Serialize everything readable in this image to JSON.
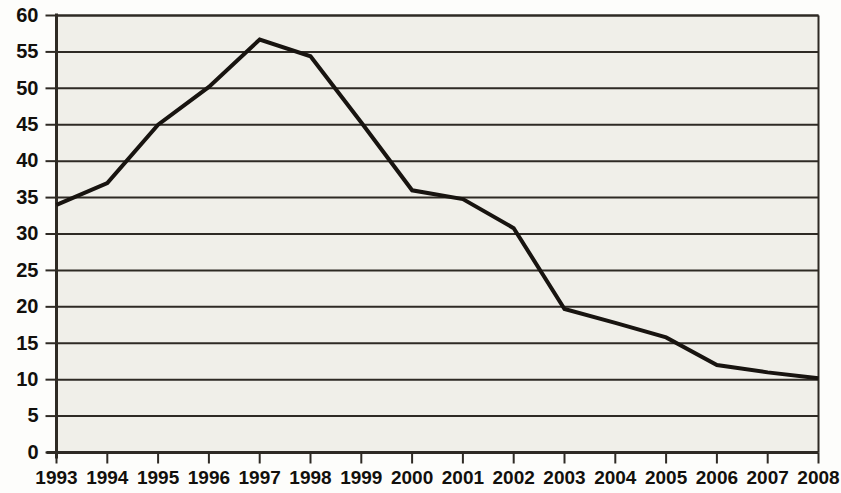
{
  "chart_data": {
    "type": "line",
    "title": "",
    "subtitle": "",
    "xlabel": "",
    "ylabel": "",
    "categories": [
      "1993",
      "1994",
      "1995",
      "1996",
      "1997",
      "1998",
      "1999",
      "2000",
      "2001",
      "2002",
      "2003",
      "2004",
      "2005",
      "2006",
      "2007",
      "2008"
    ],
    "values": [
      34,
      37,
      45,
      50.2,
      56.7,
      54.4,
      45.3,
      36,
      34.8,
      30.8,
      19.7,
      17.8,
      15.8,
      12,
      11,
      10.2
    ],
    "series": [
      {
        "name": "",
        "values": [
          34,
          37,
          45,
          50.2,
          56.7,
          54.4,
          45.3,
          36,
          34.8,
          30.8,
          19.7,
          17.8,
          15.8,
          12,
          11,
          10.2
        ]
      }
    ],
    "ylim": [
      0,
      60
    ],
    "ytick_step": 5,
    "yticks": [
      0,
      5,
      10,
      15,
      20,
      25,
      30,
      35,
      40,
      45,
      50,
      55,
      60
    ],
    "ytick_labels": [
      "0",
      "5",
      "10",
      "15",
      "20",
      "25",
      "30",
      "35",
      "40",
      "45",
      "50",
      "55",
      "60"
    ],
    "xtick_labels": [
      "1993",
      "1994",
      "1995",
      "1996",
      "1997",
      "1998",
      "1999",
      "2000",
      "2001",
      "2002",
      "2003",
      "2004",
      "2005",
      "2006",
      "2007",
      "2008"
    ],
    "grid": true,
    "grid_axis": "y",
    "legend": false,
    "legend_position": "none",
    "line_color": "#181410",
    "grid_color": "#2e2a24",
    "axis_color": "#2e2a24",
    "plot_background": "#f0efe9",
    "page_background": "#fdfdfb",
    "line_width": 4,
    "markers": false,
    "annotations": []
  }
}
